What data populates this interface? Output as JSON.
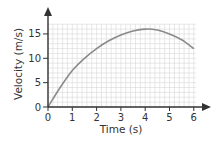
{
  "chart_data": {
    "type": "line",
    "title": "",
    "xlabel": "Time (s)",
    "ylabel": "Velocity (m/s)",
    "xlim": [
      0,
      6
    ],
    "ylim": [
      0,
      17
    ],
    "grid": true,
    "x_ticks": [
      "0",
      "1",
      "2",
      "3",
      "4",
      "5",
      "6"
    ],
    "y_ticks": [
      "0",
      "5",
      "10",
      "15"
    ],
    "series": [
      {
        "name": "velocity",
        "x": [
          0,
          0.5,
          1,
          1.5,
          2,
          2.5,
          3,
          3.5,
          4,
          4.5,
          5,
          5.5,
          6
        ],
        "y": [
          0,
          4.0,
          7.5,
          10.0,
          12.0,
          13.6,
          14.8,
          15.6,
          16.0,
          15.8,
          15.0,
          13.8,
          12.0
        ]
      }
    ],
    "colors": {
      "grid": "#d6d6d6",
      "axis": "#333333",
      "curve": "#8a8a8a"
    }
  }
}
